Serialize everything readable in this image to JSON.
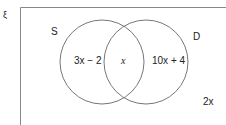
{
  "diagram": {
    "type": "venn",
    "universal_symbol": "ξ",
    "sets": [
      {
        "name": "S",
        "only_region": "3x − 2"
      },
      {
        "name": "D",
        "only_region": "10x + 4"
      }
    ],
    "intersection": "x",
    "outside": "2x",
    "colors": {
      "lines": "#777777",
      "text": "#222222"
    }
  }
}
